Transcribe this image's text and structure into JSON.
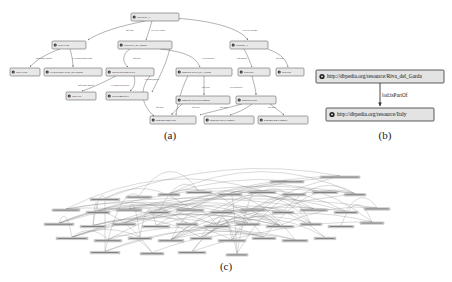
{
  "figure": {
    "caption_a": "(a)",
    "caption_b": "(b)",
    "caption_c": "(c)"
  },
  "colors": {
    "background": "#ffffff",
    "node_fill": "#e8e8e8",
    "node_stroke": "#4a4a4a",
    "edge": "#555555",
    "text": "#111111"
  },
  "panel_a": {
    "nodes": [
      {
        "id": "n0",
        "label": "lod:Serie_1",
        "x": 131,
        "y": 13,
        "w": 48,
        "h": 8,
        "bullet": true
      },
      {
        "id": "n1",
        "label": "lod:Event",
        "x": 52,
        "y": 41,
        "w": 34,
        "h": 8,
        "bullet": true
      },
      {
        "id": "n2",
        "label": "lod:Riva_del_garda",
        "x": 118,
        "y": 41,
        "w": 54,
        "h": 8,
        "bullet": true
      },
      {
        "id": "n3",
        "label": "lod:part_1",
        "x": 230,
        "y": 41,
        "w": 38,
        "h": 8,
        "bullet": true
      },
      {
        "id": "n4",
        "label": "lod:Event",
        "x": 10,
        "y": 68,
        "w": 30,
        "h": 8,
        "bullet": true
      },
      {
        "id": "n5",
        "label": "ex:describeEvent_08112008",
        "x": 44,
        "y": 68,
        "w": 58,
        "h": 8,
        "bullet": true
      },
      {
        "id": "n6",
        "label": "lod:ResearchGrCity",
        "x": 106,
        "y": 68,
        "w": 48,
        "h": 8,
        "bullet": true
      },
      {
        "id": "n7",
        "label": "dbpedia:Riva_del_Garda",
        "x": 176,
        "y": 68,
        "w": 56,
        "h": 8,
        "bullet": true
      },
      {
        "id": "n8",
        "label": "lod:Italy",
        "x": 238,
        "y": 68,
        "w": 32,
        "h": 8,
        "bullet": true
      },
      {
        "id": "n9",
        "label": "lod:Part",
        "x": 276,
        "y": 68,
        "w": 28,
        "h": 8,
        "bullet": true
      },
      {
        "id": "n10",
        "label": "lod:City",
        "x": 66,
        "y": 92,
        "w": 30,
        "h": 8,
        "bullet": true
      },
      {
        "id": "n11",
        "label": "lod:ItemsOf03",
        "x": 106,
        "y": 92,
        "w": 42,
        "h": 8,
        "bullet": true
      },
      {
        "id": "n12",
        "label": "dbpedia-owl:Settlement",
        "x": 176,
        "y": 96,
        "w": 54,
        "h": 8,
        "bullet": true
      },
      {
        "id": "n13",
        "label": "dbpedia:Italy",
        "x": 236,
        "y": 96,
        "w": 40,
        "h": 8,
        "bullet": true
      },
      {
        "id": "n14",
        "label": "schema.org:Place",
        "x": 150,
        "y": 116,
        "w": 46,
        "h": 8,
        "bullet": true
      },
      {
        "id": "n15",
        "label": "dbpedia-owl:Country",
        "x": 204,
        "y": 116,
        "w": 50,
        "h": 8,
        "bullet": true
      },
      {
        "id": "n16",
        "label": "schema.org:Country",
        "x": 258,
        "y": 116,
        "w": 50,
        "h": 8,
        "bullet": true
      }
    ],
    "edge_labels": [
      {
        "label": "rdf:type",
        "x": 130,
        "y": 31
      },
      {
        "label": "ex:relevAgent",
        "x": 158,
        "y": 31
      },
      {
        "label": "ex:relevTheme",
        "x": 250,
        "y": 31
      },
      {
        "label": "rdfs:subClassOf",
        "x": 44,
        "y": 59
      },
      {
        "label": "ex:corporationClass",
        "x": 82,
        "y": 59
      },
      {
        "label": "rdf:type",
        "x": 137,
        "y": 59
      },
      {
        "label": "ex:locatedIn",
        "x": 208,
        "y": 59
      },
      {
        "label": "lod:partOf",
        "x": 242,
        "y": 59
      },
      {
        "label": "rdf:type",
        "x": 280,
        "y": 59
      },
      {
        "label": "rdfs:subClassOf",
        "x": 86,
        "y": 86
      },
      {
        "label": "ex:innovatedWith",
        "x": 120,
        "y": 86
      },
      {
        "label": "ex:linkQuality",
        "x": 152,
        "y": 80
      },
      {
        "label": "rdf:type",
        "x": 206,
        "y": 88
      },
      {
        "label": "ex:locatedIn",
        "x": 236,
        "y": 88
      },
      {
        "label": "rdf:type",
        "x": 160,
        "y": 108
      },
      {
        "label": "rdf:type",
        "x": 196,
        "y": 108
      },
      {
        "label": "rdf:type",
        "x": 224,
        "y": 108
      },
      {
        "label": "rdf:type",
        "x": 272,
        "y": 108
      }
    ]
  },
  "panel_b": {
    "nodes": [
      {
        "id": "b0",
        "label": "http://dbpedia.org/resource/Riva_del_Garda",
        "x": 6,
        "y": 12,
        "w": 128,
        "h": 13
      },
      {
        "id": "b1",
        "label": "http://dbpedia.org/resource/Italy",
        "x": 16,
        "y": 50,
        "w": 108,
        "h": 13
      }
    ],
    "edge_label": "lod:isPartOf"
  },
  "panel_c": {
    "description": "dense RDF graph with many nodes and curved edges",
    "node_count": 46,
    "nodes": [
      {
        "x": 60,
        "y": 82,
        "w": 30,
        "h": 4
      },
      {
        "x": 96,
        "y": 78,
        "w": 26,
        "h": 4
      },
      {
        "x": 128,
        "y": 74,
        "w": 22,
        "h": 4
      },
      {
        "x": 156,
        "y": 70,
        "w": 26,
        "h": 4
      },
      {
        "x": 188,
        "y": 74,
        "w": 24,
        "h": 4
      },
      {
        "x": 218,
        "y": 70,
        "w": 28,
        "h": 4
      },
      {
        "x": 252,
        "y": 74,
        "w": 24,
        "h": 4
      },
      {
        "x": 282,
        "y": 70,
        "w": 26,
        "h": 4
      },
      {
        "x": 314,
        "y": 74,
        "w": 22,
        "h": 4
      },
      {
        "x": 22,
        "y": 100,
        "w": 28,
        "h": 4
      },
      {
        "x": 56,
        "y": 104,
        "w": 24,
        "h": 4
      },
      {
        "x": 86,
        "y": 100,
        "w": 26,
        "h": 4
      },
      {
        "x": 118,
        "y": 104,
        "w": 22,
        "h": 4
      },
      {
        "x": 146,
        "y": 100,
        "w": 28,
        "h": 4
      },
      {
        "x": 180,
        "y": 104,
        "w": 24,
        "h": 4
      },
      {
        "x": 210,
        "y": 100,
        "w": 26,
        "h": 4
      },
      {
        "x": 242,
        "y": 104,
        "w": 22,
        "h": 4
      },
      {
        "x": 270,
        "y": 100,
        "w": 28,
        "h": 4
      },
      {
        "x": 304,
        "y": 104,
        "w": 24,
        "h": 4
      },
      {
        "x": 334,
        "y": 98,
        "w": 26,
        "h": 4
      },
      {
        "x": 14,
        "y": 124,
        "w": 30,
        "h": 4
      },
      {
        "x": 50,
        "y": 128,
        "w": 26,
        "h": 4
      },
      {
        "x": 82,
        "y": 124,
        "w": 24,
        "h": 4
      },
      {
        "x": 112,
        "y": 128,
        "w": 28,
        "h": 4
      },
      {
        "x": 146,
        "y": 124,
        "w": 22,
        "h": 4
      },
      {
        "x": 174,
        "y": 128,
        "w": 26,
        "h": 4
      },
      {
        "x": 206,
        "y": 124,
        "w": 24,
        "h": 4
      },
      {
        "x": 236,
        "y": 128,
        "w": 28,
        "h": 4
      },
      {
        "x": 270,
        "y": 124,
        "w": 22,
        "h": 4
      },
      {
        "x": 298,
        "y": 128,
        "w": 26,
        "h": 4
      },
      {
        "x": 330,
        "y": 122,
        "w": 24,
        "h": 4
      },
      {
        "x": 26,
        "y": 148,
        "w": 32,
        "h": 4
      },
      {
        "x": 64,
        "y": 152,
        "w": 28,
        "h": 4
      },
      {
        "x": 98,
        "y": 148,
        "w": 24,
        "h": 4
      },
      {
        "x": 128,
        "y": 152,
        "w": 26,
        "h": 4
      },
      {
        "x": 160,
        "y": 148,
        "w": 22,
        "h": 4
      },
      {
        "x": 188,
        "y": 152,
        "w": 28,
        "h": 4
      },
      {
        "x": 222,
        "y": 148,
        "w": 24,
        "h": 4
      },
      {
        "x": 252,
        "y": 152,
        "w": 26,
        "h": 4
      },
      {
        "x": 284,
        "y": 148,
        "w": 22,
        "h": 4
      },
      {
        "x": 60,
        "y": 172,
        "w": 30,
        "h": 4
      },
      {
        "x": 110,
        "y": 174,
        "w": 24,
        "h": 4
      },
      {
        "x": 148,
        "y": 172,
        "w": 28,
        "h": 4
      },
      {
        "x": 196,
        "y": 176,
        "w": 22,
        "h": 4
      },
      {
        "x": 240,
        "y": 52,
        "w": 34,
        "h": 4
      },
      {
        "x": 290,
        "y": 44,
        "w": 40,
        "h": 4
      }
    ]
  }
}
